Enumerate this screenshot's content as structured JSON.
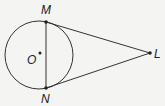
{
  "diagram": {
    "circle": {
      "center_label": "O",
      "cx": 39,
      "cy": 55,
      "r": 34
    },
    "points": {
      "M": {
        "label": "M",
        "x": 46,
        "y": 22
      },
      "N": {
        "label": "N",
        "x": 46,
        "y": 88
      },
      "L": {
        "label": "L",
        "x": 150,
        "y": 53
      },
      "O": {
        "label": "O",
        "x": 40,
        "y": 53
      }
    },
    "segments": [
      {
        "from": "M",
        "to": "N",
        "name": "chord-MN"
      },
      {
        "from": "M",
        "to": "L",
        "name": "tangent-ML"
      },
      {
        "from": "N",
        "to": "L",
        "name": "tangent-NL"
      }
    ],
    "colors": {
      "stroke": "#333333",
      "background": "#f4f4f2"
    }
  }
}
